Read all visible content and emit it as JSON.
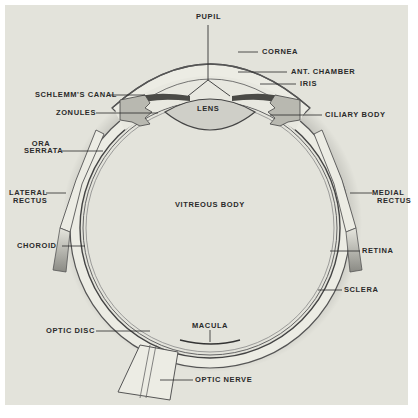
{
  "diagram": {
    "labels": {
      "pupil": "PUPIL",
      "cornea": "CORNEA",
      "ant_chamber": "ANT. CHAMBER",
      "iris": "IRIS",
      "schlemms_canal": "SCHLEMM'S CANAL",
      "zonules": "ZONULES",
      "lens": "LENS",
      "ciliary_body": "CILIARY BODY",
      "ora_serrata_1": "ORA",
      "ora_serrata_2": "SERRATA",
      "lateral_rectus_1": "LATERAL",
      "lateral_rectus_2": "RECTUS",
      "medial_rectus_1": "MEDIAL",
      "medial_rectus_2": "RECTUS",
      "vitreous_body": "VITREOUS BODY",
      "choroid": "CHOROID",
      "retina": "RETINA",
      "sclera": "SCLERA",
      "optic_disc": "OPTIC DISC",
      "macula": "MACULA",
      "optic_nerve": "OPTIC NERVE"
    },
    "colors": {
      "background": "#e3e3db",
      "frame": "#ffffff",
      "sclera_fill": "#ecece4",
      "tissue_dark": "#5a5a55",
      "leader_line": "#2a2a2a"
    }
  }
}
